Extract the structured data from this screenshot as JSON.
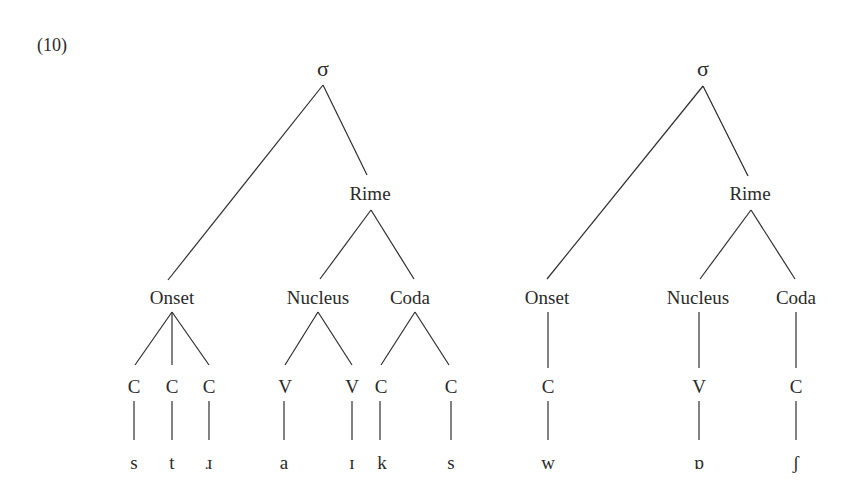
{
  "example_number": "(10)",
  "trees": [
    {
      "id": "strikes",
      "root": "σ",
      "rime": "Rime",
      "onset": "Onset",
      "nucleus": "Nucleus",
      "coda": "Coda",
      "skeleton": [
        "C",
        "C",
        "C",
        "V",
        "V",
        "C",
        "C"
      ],
      "segments": [
        "s",
        "t",
        "ɹ",
        "a",
        "ɪ",
        "k",
        "s"
      ]
    },
    {
      "id": "wash",
      "root": "σ",
      "rime": "Rime",
      "onset": "Onset",
      "nucleus": "Nucleus",
      "coda": "Coda",
      "skeleton": [
        "C",
        "V",
        "C"
      ],
      "segments": [
        "w",
        "ɒ",
        "ʃ"
      ]
    }
  ]
}
